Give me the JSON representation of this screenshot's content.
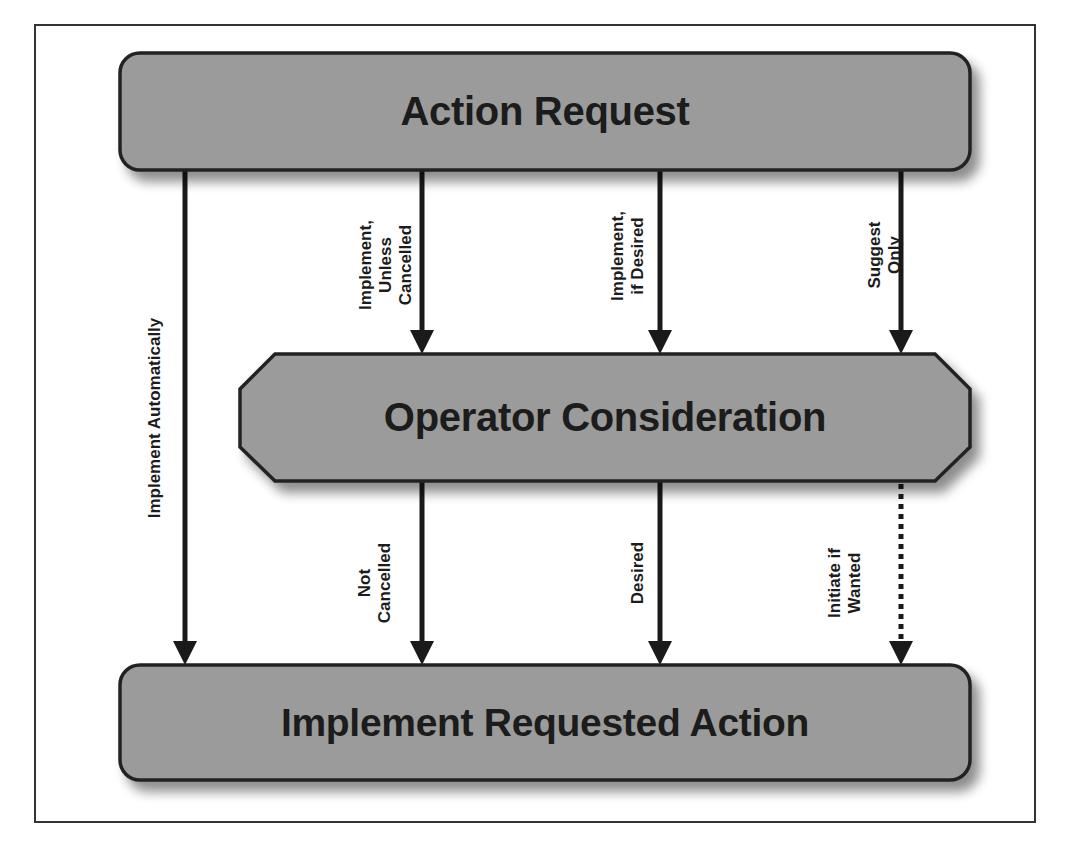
{
  "diagram": {
    "type": "flowchart",
    "colors": {
      "box_fill": "#9b9b9b",
      "box_border": "#222222",
      "arrow": "#1a1a1a",
      "frame": "#333333",
      "shadow": "#888888"
    },
    "nodes": {
      "top": {
        "label": "Action Request",
        "shape": "rounded-rectangle"
      },
      "middle": {
        "label": "Operator Consideration",
        "shape": "octagon"
      },
      "bottom": {
        "label": "Implement Requested Action",
        "shape": "rounded-rectangle"
      }
    },
    "edges": [
      {
        "from": "Action Request",
        "to": "Implement Requested Action",
        "label": "Implement Automatically",
        "style": "solid"
      },
      {
        "from": "Action Request",
        "to": "Operator Consideration",
        "label": "Implement,\nUnless\nCancelled",
        "style": "solid"
      },
      {
        "from": "Action Request",
        "to": "Operator Consideration",
        "label": "Implement,\nif Desired",
        "style": "solid"
      },
      {
        "from": "Action Request",
        "to": "Operator Consideration",
        "label": "Suggest\nOnly",
        "style": "solid"
      },
      {
        "from": "Operator Consideration",
        "to": "Implement Requested Action",
        "label": "Not\nCancelled",
        "style": "solid"
      },
      {
        "from": "Operator Consideration",
        "to": "Implement Requested Action",
        "label": "Desired",
        "style": "solid"
      },
      {
        "from": "Operator Consideration",
        "to": "Implement Requested Action",
        "label": "Initiate if\nWanted",
        "style": "dotted"
      }
    ]
  }
}
